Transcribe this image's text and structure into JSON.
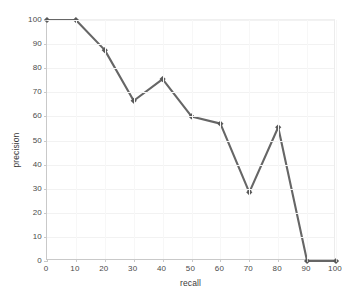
{
  "chart_data": {
    "type": "line",
    "title": "",
    "xlabel": "recall",
    "ylabel": "precision",
    "xlim": [
      0,
      100
    ],
    "ylim": [
      0,
      100
    ],
    "xticks": [
      0,
      10,
      20,
      30,
      40,
      50,
      60,
      70,
      80,
      90,
      100
    ],
    "yticks": [
      0,
      10,
      20,
      30,
      40,
      50,
      60,
      70,
      80,
      90,
      100
    ],
    "grid": true,
    "legend": false,
    "marker": "diamond",
    "line_color": "#666666",
    "marker_color": "#595959",
    "x": [
      0,
      10,
      20,
      30,
      40,
      50,
      60,
      70,
      80,
      90,
      100
    ],
    "values": [
      100,
      100,
      87.5,
      66.5,
      75.5,
      60,
      57,
      28.5,
      55.5,
      0,
      0
    ],
    "series": [
      {
        "name": "precision",
        "x": [
          0,
          10,
          20,
          30,
          40,
          50,
          60,
          70,
          80,
          90,
          100
        ],
        "values": [
          100,
          100,
          87.5,
          66.5,
          75.5,
          60,
          57,
          28.5,
          55.5,
          0,
          0
        ]
      }
    ]
  },
  "axes": {
    "x_title": "recall",
    "y_title": "precision",
    "x_tick_labels": [
      "0",
      "10",
      "20",
      "30",
      "40",
      "50",
      "60",
      "70",
      "80",
      "90",
      "100"
    ],
    "y_tick_labels": [
      "0",
      "10",
      "20",
      "30",
      "40",
      "50",
      "60",
      "70",
      "80",
      "90",
      "100"
    ]
  }
}
